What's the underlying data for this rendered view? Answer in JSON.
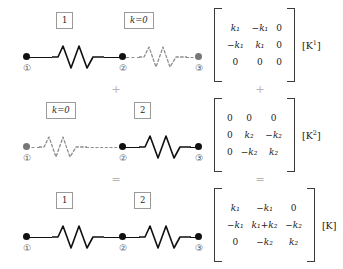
{
  "figure": {
    "node_labels": [
      "①",
      "②",
      "③"
    ],
    "operators": {
      "plus": "+",
      "equals": "="
    }
  },
  "rows": [
    {
      "id": "element-1",
      "left_element": {
        "label": "1",
        "style": "active",
        "italic": false
      },
      "right_element": {
        "label": "k=0",
        "style": "inactive",
        "italic": true
      },
      "matrix": {
        "label_text": "[K",
        "label_sup": "1",
        "label_close": "]",
        "rows": [
          [
            "k₁",
            "−k₁",
            "0"
          ],
          [
            "−k₁",
            "k₁",
            "0"
          ],
          [
            "0",
            "0",
            "0"
          ]
        ]
      }
    },
    {
      "id": "element-2",
      "left_element": {
        "label": "k=0",
        "style": "inactive",
        "italic": true
      },
      "right_element": {
        "label": "2",
        "style": "active",
        "italic": false
      },
      "matrix": {
        "label_text": "[K",
        "label_sup": "2",
        "label_close": "]",
        "rows": [
          [
            "0",
            "0",
            "0"
          ],
          [
            "0",
            "k₂",
            "−k₂"
          ],
          [
            "0",
            "−k₂",
            "k₂"
          ]
        ]
      }
    },
    {
      "id": "global",
      "left_element": {
        "label": "1",
        "style": "active",
        "italic": false
      },
      "right_element": {
        "label": "2",
        "style": "active",
        "italic": false
      },
      "matrix": {
        "label_text": "[K",
        "label_sup": "",
        "label_close": "]",
        "rows": [
          [
            "k₁",
            "−k₁",
            "0"
          ],
          [
            "−k₁",
            "k₁+k₂",
            "−k₂"
          ],
          [
            "0",
            "−k₂",
            "k₂"
          ]
        ]
      }
    }
  ]
}
